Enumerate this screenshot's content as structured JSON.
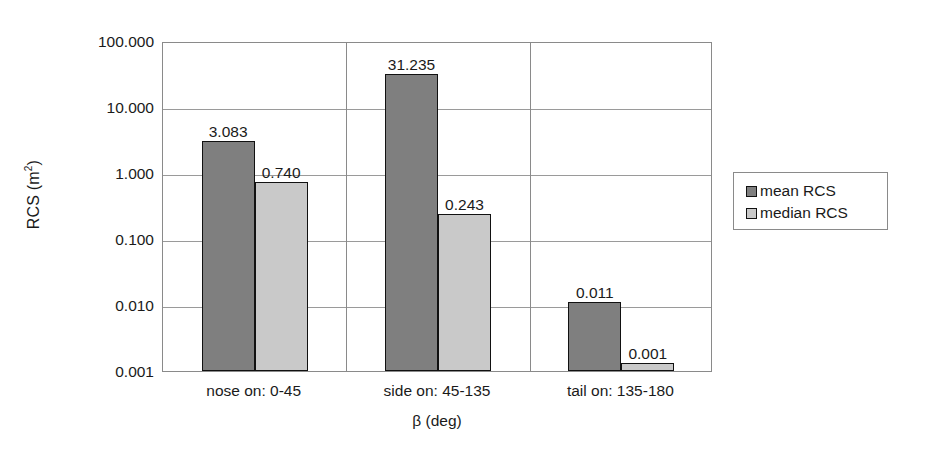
{
  "chart_data": {
    "type": "bar",
    "title": "",
    "xlabel": "β (deg)",
    "ylabel": "RCS (m²)",
    "yscale": "log",
    "ylim": [
      0.001,
      100
    ],
    "yticks": [
      "100.000",
      "10.000",
      "1.000",
      "0.100",
      "0.010",
      "0.001"
    ],
    "ytick_values": [
      100,
      10,
      1,
      0.1,
      0.01,
      0.001
    ],
    "grid": true,
    "legend_position": "right",
    "categories": [
      "nose on:  0-45",
      "side on: 45-135",
      "tail on: 135-180"
    ],
    "series": [
      {
        "name": "mean RCS",
        "color": "#7f7f7f",
        "values": [
          3.083,
          31.235,
          0.011
        ],
        "labels": [
          "3.083",
          "31.235",
          "0.011"
        ]
      },
      {
        "name": "median RCS",
        "color": "#c9c9c9",
        "values": [
          0.74,
          0.243,
          0.001
        ],
        "labels": [
          "0.740",
          "0.243",
          "0.001"
        ]
      }
    ]
  },
  "axes": {
    "y_title_main": "RCS (m",
    "y_title_sup": "2",
    "y_title_close": ")",
    "x_title": "β (deg)"
  },
  "colors": {
    "mean": "#7f7f7f",
    "median": "#c9c9c9",
    "border": "#111111",
    "grid": "#9a9a9a",
    "frame": "#8a8a8a",
    "background": "#ffffff"
  }
}
